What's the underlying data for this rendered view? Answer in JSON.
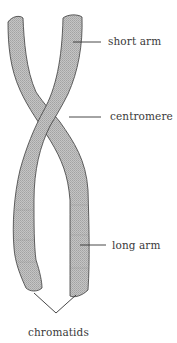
{
  "labels": {
    "short_arm": "short arm",
    "centromere": "centromere",
    "long_arm": "long arm",
    "chromatids": "chromatids"
  },
  "colors": {
    "chromatid_fill": "#b9b9b9",
    "outline": "#3c3c3c",
    "text": "#3a3a3a",
    "leader_line": "#333333",
    "background": "#ffffff"
  },
  "parts": [
    {
      "id": "short-arm",
      "label": "short arm"
    },
    {
      "id": "centromere",
      "label": "centromere"
    },
    {
      "id": "long-arm",
      "label": "long arm"
    },
    {
      "id": "chromatids",
      "label": "chromatids"
    }
  ]
}
